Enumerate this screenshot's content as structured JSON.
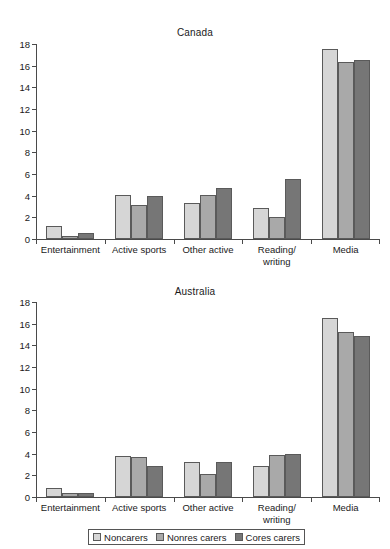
{
  "chart_data": [
    {
      "type": "bar",
      "title": "Canada",
      "xlabel": "",
      "ylabel": "",
      "ylim": [
        0,
        18
      ],
      "yticks": [
        0,
        2,
        4,
        6,
        8,
        10,
        12,
        14,
        16,
        18
      ],
      "grid": false,
      "legend_position": "bottom",
      "categories": [
        "Entertainment",
        "Active sports",
        "Other active",
        "Reading/\nwriting",
        "Media"
      ],
      "series": [
        {
          "name": "Noncarers",
          "color": "#d6d6d6",
          "values": [
            1.2,
            4.1,
            3.35,
            2.9,
            17.5
          ]
        },
        {
          "name": "Nonres carers",
          "color": "#a9a9a9",
          "values": [
            0.3,
            3.1,
            4.05,
            2.0,
            16.3
          ]
        },
        {
          "name": "Cores carers",
          "color": "#767676",
          "values": [
            0.6,
            4.0,
            4.7,
            5.5,
            16.5
          ]
        }
      ]
    },
    {
      "type": "bar",
      "title": "Australia",
      "xlabel": "",
      "ylabel": "",
      "ylim": [
        0,
        18
      ],
      "yticks": [
        0,
        2,
        4,
        6,
        8,
        10,
        12,
        14,
        16,
        18
      ],
      "grid": false,
      "legend_position": "bottom",
      "categories": [
        "Entertainment",
        "Active sports",
        "Other active",
        "Reading/\nwriting",
        "Media"
      ],
      "series": [
        {
          "name": "Noncarers",
          "color": "#d6d6d6",
          "values": [
            0.8,
            3.8,
            3.2,
            2.9,
            16.5
          ]
        },
        {
          "name": "Nonres carers",
          "color": "#a9a9a9",
          "values": [
            0.35,
            3.7,
            2.1,
            3.9,
            15.2
          ]
        },
        {
          "name": "Cores carers",
          "color": "#767676",
          "values": [
            0.35,
            2.9,
            3.2,
            4.0,
            14.9
          ]
        }
      ]
    }
  ],
  "legend": {
    "items": [
      {
        "label": "Noncarers",
        "color": "#d6d6d6"
      },
      {
        "label": "Nonres carers",
        "color": "#a9a9a9"
      },
      {
        "label": "Cores carers",
        "color": "#767676"
      }
    ]
  }
}
